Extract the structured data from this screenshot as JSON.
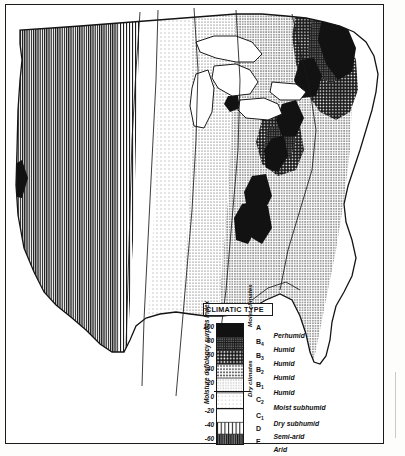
{
  "figure": {
    "kind": "climatic-type-map",
    "region": "eastern and central United States"
  },
  "legend": {
    "title": "CLIMATIC TYPE",
    "axis_title": "Moisture deficiency surplus index",
    "scale_values": [
      "100",
      "80",
      "60",
      "40",
      "20",
      "0",
      "-20",
      "-40",
      "-60"
    ],
    "group_moist": "Moist climates",
    "group_dry": "Dry climates",
    "entries": [
      {
        "symbol": "A",
        "sub": "",
        "label": "Perhumid",
        "pattern": "solid-black",
        "index_top": 100,
        "index_bottom": 100
      },
      {
        "symbol": "B",
        "sub": "4",
        "label": "Humid",
        "pattern": "dense-check-dark",
        "index_top": 100,
        "index_bottom": 80
      },
      {
        "symbol": "B",
        "sub": "3",
        "label": "Humid",
        "pattern": "white-dots-on-black",
        "index_top": 80,
        "index_bottom": 60
      },
      {
        "symbol": "B",
        "sub": "2",
        "label": "Humid",
        "pattern": "black-dots-on-white",
        "index_top": 60,
        "index_bottom": 40
      },
      {
        "symbol": "B",
        "sub": "1",
        "label": "Humid",
        "pattern": "medium-dots",
        "index_top": 40,
        "index_bottom": 20
      },
      {
        "symbol": "C",
        "sub": "2",
        "label": "Moist subhumid",
        "pattern": "sparse-dots",
        "index_top": 20,
        "index_bottom": 0
      },
      {
        "symbol": "C",
        "sub": "1",
        "label": "Dry subhumid",
        "pattern": "blank-white",
        "index_top": 0,
        "index_bottom": -20
      },
      {
        "symbol": "D",
        "sub": "",
        "label": "Semi-arid",
        "pattern": "vertical-lines",
        "index_top": -20,
        "index_bottom": -40
      },
      {
        "symbol": "E",
        "sub": "",
        "label": "Arid",
        "pattern": "dense-vertical-lines",
        "index_top": -40,
        "index_bottom": -60
      }
    ]
  },
  "colors": {
    "ink": "#141414",
    "paper": "#ffffff",
    "frame": "#1a1a1a"
  }
}
